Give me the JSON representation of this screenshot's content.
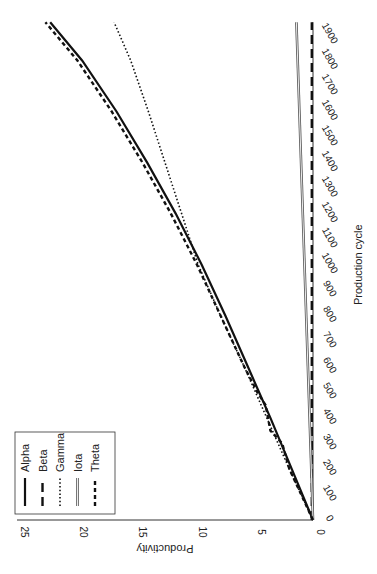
{
  "chart_data": {
    "type": "line",
    "title": "",
    "xlabel": "Production cycle",
    "ylabel": "Productivity",
    "xlim": [
      0,
      1950
    ],
    "ylim": [
      0,
      25
    ],
    "x_ticks": [
      0,
      100,
      200,
      300,
      400,
      500,
      600,
      700,
      800,
      900,
      1000,
      1100,
      1200,
      1300,
      1400,
      1500,
      1600,
      1700,
      1800,
      1900
    ],
    "y_ticks": [
      0,
      5,
      10,
      15,
      20,
      25
    ],
    "grid": false,
    "legend_position": "upper-left",
    "orientation": "rotated-90-ccw",
    "series": [
      {
        "name": "Alpha",
        "style": "solid",
        "color": "#111111",
        "x": [
          0,
          200,
          400,
          600,
          800,
          1000,
          1200,
          1400,
          1600,
          1800,
          1950
        ],
        "values": [
          0,
          1.8,
          3.6,
          5.5,
          7.4,
          9.4,
          11.6,
          14.0,
          16.6,
          19.5,
          22.2
        ]
      },
      {
        "name": "Beta",
        "style": "long-dash",
        "color": "#111111",
        "x": [
          0,
          500,
          1000,
          1500,
          1950
        ],
        "values": [
          0.1,
          0.1,
          0.1,
          0.1,
          0.1
        ]
      },
      {
        "name": "Gamma",
        "style": "dotted",
        "color": "#111111",
        "x": [
          0,
          200,
          400,
          600,
          800,
          1000,
          1200,
          1400,
          1600,
          1800,
          1950
        ],
        "values": [
          0,
          2.0,
          3.9,
          5.8,
          7.8,
          9.7,
          11.1,
          12.5,
          13.9,
          15.4,
          16.8
        ]
      },
      {
        "name": "Iota",
        "style": "double-line",
        "color": "#555555",
        "x": [
          0,
          1950
        ],
        "values": [
          0,
          1.4
        ]
      },
      {
        "name": "Theta",
        "style": "short-dash",
        "color": "#111111",
        "x": [
          0,
          200,
          300,
          350,
          400,
          450,
          500,
          600,
          800,
          1000,
          1200,
          1400,
          1600,
          1800,
          1950
        ],
        "values": [
          0,
          2.0,
          2.6,
          3.6,
          3.8,
          4.0,
          4.7,
          5.8,
          7.8,
          9.8,
          12.0,
          14.4,
          17.0,
          19.9,
          22.6
        ]
      }
    ]
  }
}
